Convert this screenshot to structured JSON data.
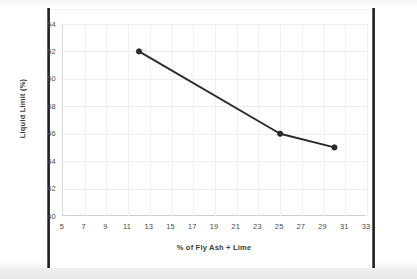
{
  "chart_data": {
    "type": "line",
    "title": "",
    "xlabel": "% of Fly Ash + Lime",
    "ylabel": "Liquid Limit (%)",
    "xlim": [
      5,
      33
    ],
    "ylim": [
      40,
      54
    ],
    "xticks": [
      5,
      7,
      9,
      11,
      13,
      15,
      17,
      19,
      21,
      23,
      25,
      27,
      29,
      31,
      33
    ],
    "yticks": [
      40,
      42,
      44,
      46,
      48,
      50,
      52,
      54
    ],
    "grid": true,
    "legend": "none",
    "series": [
      {
        "name": "Liquid Limit",
        "color": "#2b2b2b",
        "marker": "circle",
        "x": [
          12,
          25,
          30
        ],
        "values": [
          52,
          46,
          45
        ]
      }
    ]
  },
  "axes": {
    "x_title": "% of Fly Ash + Lime",
    "y_title": "Liquid Limit (%)"
  }
}
